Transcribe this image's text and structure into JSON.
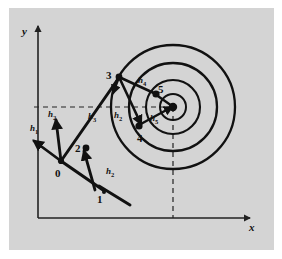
{
  "figure": {
    "title": "",
    "background_color": "#d4d4d4",
    "ink_color": "#111111",
    "axes": {
      "x_label": "x",
      "y_label": "y",
      "origin": [
        38,
        218
      ],
      "x_end": [
        252,
        218
      ],
      "y_end": [
        38,
        24
      ]
    },
    "guides": {
      "horizontal_dashed_y": 107,
      "horizontal_dashed_x_start": 34,
      "horizontal_dashed_x_end": 176,
      "vertical_dashed_x": 173,
      "vertical_dashed_y_start": 107,
      "vertical_dashed_y_end": 218
    },
    "contours": {
      "center": [
        173,
        107
      ],
      "radii": [
        13,
        27,
        44,
        62
      ],
      "count": 4
    },
    "iterate_points": [
      {
        "label": "0",
        "x": 61,
        "y": 161,
        "label_dx": -6,
        "label_dy": 10
      },
      {
        "label": "1",
        "x": 99,
        "y": 186,
        "label_dx": -2,
        "label_dy": 12
      },
      {
        "label": "2",
        "x": 86,
        "y": 148,
        "label_dx": -11,
        "label_dy": 1
      },
      {
        "label": "3",
        "x": 119,
        "y": 77,
        "label_dx": -13,
        "label_dy": -2
      },
      {
        "label": "4",
        "x": 139,
        "y": 125,
        "label_dx": -2,
        "label_dy": 13
      },
      {
        "label": "5",
        "x": 155,
        "y": 94,
        "label_dx": 4,
        "label_dy": -5
      }
    ],
    "step_labels": [
      {
        "name": "h1",
        "base": "h",
        "sub": "1",
        "x": 36,
        "y": 127
      },
      {
        "name": "h2",
        "base": "h",
        "sub": "2",
        "x": 51,
        "y": 115
      },
      {
        "name": "h3",
        "base": "h",
        "sub": "3",
        "x": 91,
        "y": 116
      },
      {
        "name": "h2b",
        "base": "h",
        "sub": "2",
        "x": 116,
        "y": 115
      },
      {
        "name": "h2c",
        "base": "h",
        "sub": "2",
        "x": 110,
        "y": 171
      },
      {
        "name": "h4",
        "base": "h",
        "sub": "4",
        "x": 140,
        "y": 80
      },
      {
        "name": "h5",
        "base": "h",
        "sub": "5",
        "x": 154,
        "y": 118
      }
    ],
    "search_path": [
      [
        61,
        161
      ],
      [
        99,
        186
      ],
      [
        86,
        148
      ],
      [
        119,
        77
      ],
      [
        139,
        125
      ],
      [
        155,
        94
      ],
      [
        173,
        107
      ]
    ],
    "direction_arrows": [
      {
        "name": "arrow-h1",
        "from": [
          61,
          161
        ],
        "to": [
          33,
          140
        ]
      },
      {
        "name": "arrow-h2",
        "from": [
          61,
          161
        ],
        "to": [
          55,
          119
        ]
      },
      {
        "name": "arrow-h2-lower",
        "from": [
          95,
          190
        ],
        "to": [
          83,
          152
        ]
      },
      {
        "name": "arrow-h3",
        "from": [
          61,
          161
        ],
        "to": [
          117,
          80
        ]
      },
      {
        "name": "arrow-h2-upper",
        "from": [
          119,
          77
        ],
        "to": [
          112,
          95
        ]
      },
      {
        "name": "arrow-h4",
        "from": [
          119,
          77
        ],
        "to": [
          142,
          126
        ]
      },
      {
        "name": "arrow-h5",
        "from": [
          139,
          125
        ],
        "to": [
          175,
          106
        ]
      }
    ]
  }
}
